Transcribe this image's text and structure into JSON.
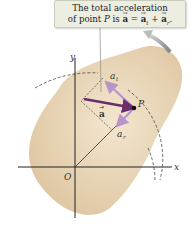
{
  "callout": {
    "line1": "The total acceleration",
    "line2_prefix": "of point ",
    "point": "P",
    "line2_is": " is ",
    "vec_a": "a",
    "eq": " = ",
    "vec_at": "a",
    "sub_t": "t",
    "plus": " + ",
    "vec_ar": "a",
    "sub_r": "r",
    "period": "."
  },
  "labels": {
    "y_axis": "y",
    "x_axis": "x",
    "origin": "O",
    "point": "P",
    "a_total": "a",
    "a_t": "a",
    "a_t_sub": "t",
    "a_r": "a",
    "a_r_sub": "r"
  },
  "colors": {
    "body_fill": "#ecd9bd",
    "body_shade": "#d9bf98",
    "arrow_total": "#6b2d6b",
    "arrow_component": "#b894c8",
    "axis": "#222222",
    "dashed": "#444444",
    "rotation_arrow": "#8a8d8a",
    "callout_bg": "#eceee2"
  }
}
